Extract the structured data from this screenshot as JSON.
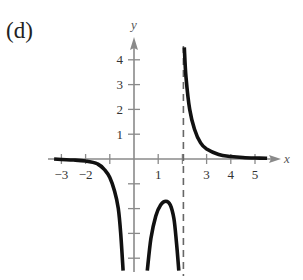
{
  "panel_label": "(d)",
  "chart_data": {
    "type": "line",
    "title": "(d)",
    "xlabel": "x",
    "ylabel": "y",
    "xlim": [
      -3.5,
      5.8
    ],
    "ylim": [
      -4.5,
      4.8
    ],
    "grid": false,
    "legend": null,
    "x_ticks": [
      -3,
      -2,
      -1,
      1,
      2,
      3,
      4,
      5
    ],
    "x_tick_labels": [
      "−3",
      "−2",
      "",
      "1",
      "",
      "3",
      "4",
      "5"
    ],
    "y_ticks": [
      4,
      3,
      2,
      1,
      -1,
      -2,
      -3,
      -4
    ],
    "y_tick_labels": [
      "4",
      "3",
      "2",
      "1",
      "",
      "",
      "",
      ""
    ],
    "asymptotes": [
      {
        "type": "vertical",
        "x": 0,
        "style": "implicit (y-axis)"
      },
      {
        "type": "vertical",
        "x": 2,
        "style": "dashed"
      },
      {
        "type": "horizontal",
        "y": 0,
        "style": "x-axis"
      }
    ],
    "series": [
      {
        "name": "left-branch",
        "points": [
          [
            -3.3,
            0.0
          ],
          [
            -3.0,
            -0.02
          ],
          [
            -2.5,
            -0.04
          ],
          [
            -2.0,
            -0.08
          ],
          [
            -1.5,
            -0.2
          ],
          [
            -1.2,
            -0.45
          ],
          [
            -1.0,
            -0.75
          ],
          [
            -0.8,
            -1.3
          ],
          [
            -0.65,
            -2.0
          ],
          [
            -0.55,
            -3.0
          ],
          [
            -0.45,
            -4.5
          ]
        ]
      },
      {
        "name": "middle-branch",
        "points": [
          [
            0.55,
            -4.5
          ],
          [
            0.7,
            -3.2
          ],
          [
            0.9,
            -2.3
          ],
          [
            1.1,
            -1.85
          ],
          [
            1.32,
            -1.7
          ],
          [
            1.5,
            -1.85
          ],
          [
            1.65,
            -2.4
          ],
          [
            1.75,
            -3.3
          ],
          [
            1.85,
            -4.5
          ]
        ]
      },
      {
        "name": "right-branch",
        "points": [
          [
            2.08,
            4.5
          ],
          [
            2.15,
            3.3
          ],
          [
            2.3,
            2.0
          ],
          [
            2.5,
            1.2
          ],
          [
            2.75,
            0.65
          ],
          [
            3.0,
            0.4
          ],
          [
            3.5,
            0.18
          ],
          [
            4.0,
            0.1
          ],
          [
            4.5,
            0.06
          ],
          [
            5.0,
            0.04
          ],
          [
            5.5,
            0.03
          ]
        ]
      }
    ]
  }
}
